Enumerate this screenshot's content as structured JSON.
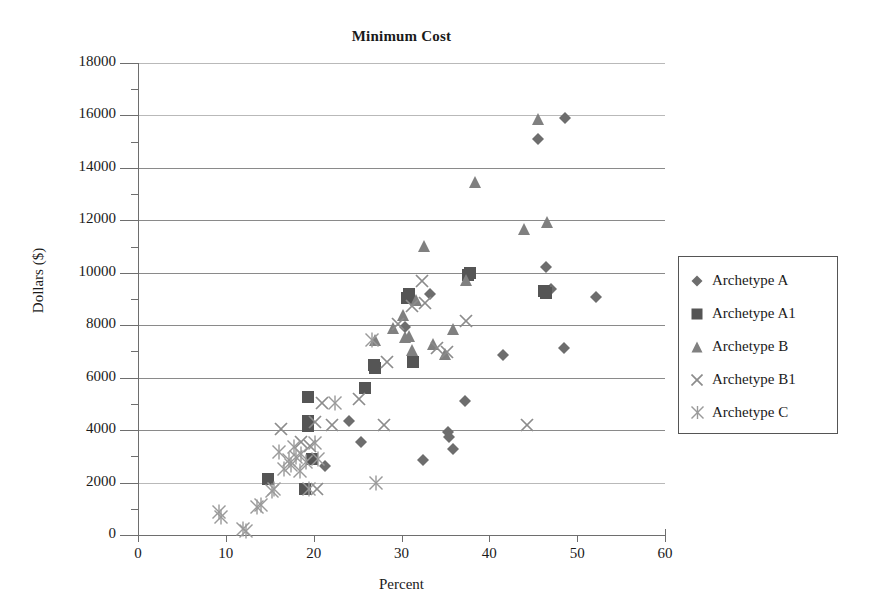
{
  "chart_data": {
    "type": "scatter",
    "title": "Minimum Cost",
    "xlabel": "Percent",
    "ylabel": "Dollars ($)",
    "xlim": [
      0,
      60
    ],
    "ylim": [
      0,
      18000
    ],
    "xticks": [
      "0",
      "10",
      "20",
      "30",
      "40",
      "50",
      "60"
    ],
    "yticks": [
      "0",
      "2000",
      "4000",
      "6000",
      "8000",
      "10000",
      "12000",
      "14000",
      "16000",
      "18000"
    ],
    "grid": "horizontal",
    "legend_position": "right",
    "series": [
      {
        "name": "Archetype A",
        "marker": "diamond",
        "color": "#6d6d6d",
        "points": [
          [
            21.3,
            2620
          ],
          [
            24.0,
            4350
          ],
          [
            25.4,
            3540
          ],
          [
            30.4,
            7930
          ],
          [
            32.4,
            2850
          ],
          [
            33.3,
            9180
          ],
          [
            35.3,
            3930
          ],
          [
            35.4,
            3750
          ],
          [
            35.9,
            3270
          ],
          [
            37.2,
            5120
          ],
          [
            41.5,
            6880
          ],
          [
            46.5,
            10220
          ],
          [
            47.0,
            9370
          ],
          [
            48.6,
            15900
          ],
          [
            45.5,
            15120
          ],
          [
            48.5,
            7130
          ],
          [
            52.2,
            9070
          ]
        ]
      },
      {
        "name": "Archetype A1",
        "marker": "square",
        "color": "#555555",
        "points": [
          [
            14.8,
            2150
          ],
          [
            19.0,
            1740
          ],
          [
            19.4,
            5280
          ],
          [
            19.3,
            4330
          ],
          [
            19.4,
            4140
          ],
          [
            19.8,
            2900
          ],
          [
            25.8,
            5600
          ],
          [
            26.9,
            6480
          ],
          [
            27.0,
            6350
          ],
          [
            30.8,
            9180
          ],
          [
            30.6,
            9030
          ],
          [
            31.3,
            6600
          ],
          [
            37.8,
            10010
          ],
          [
            37.6,
            9930
          ],
          [
            46.2,
            9300
          ],
          [
            46.4,
            9220
          ]
        ]
      },
      {
        "name": "Archetype B",
        "marker": "triangle",
        "color": "#808080",
        "points": [
          [
            27.0,
            7420
          ],
          [
            29.0,
            7900
          ],
          [
            30.2,
            8380
          ],
          [
            30.4,
            7560
          ],
          [
            30.9,
            7600
          ],
          [
            31.2,
            7070
          ],
          [
            31.7,
            8950
          ],
          [
            32.6,
            11020
          ],
          [
            33.6,
            7270
          ],
          [
            34.9,
            6900
          ],
          [
            35.9,
            7860
          ],
          [
            37.3,
            9730
          ],
          [
            38.4,
            13470
          ],
          [
            43.9,
            11670
          ],
          [
            45.5,
            15860
          ],
          [
            46.6,
            11940
          ]
        ]
      },
      {
        "name": "Archetype B1",
        "marker": "x",
        "color": "#8c8c8c",
        "points": [
          [
            16.3,
            4040
          ],
          [
            18.6,
            3560
          ],
          [
            19.6,
            3400
          ],
          [
            20.2,
            4300
          ],
          [
            20.4,
            1760
          ],
          [
            21.0,
            5030
          ],
          [
            22.1,
            4200
          ],
          [
            25.2,
            5200
          ],
          [
            28.0,
            4210
          ],
          [
            28.4,
            6610
          ],
          [
            29.6,
            8030
          ],
          [
            31.2,
            8740
          ],
          [
            32.3,
            9680
          ],
          [
            32.7,
            8830
          ],
          [
            34.0,
            7120
          ],
          [
            35.2,
            6990
          ],
          [
            37.3,
            8150
          ],
          [
            44.3,
            4190
          ]
        ]
      },
      {
        "name": "Archetype C",
        "marker": "asterisk",
        "color": "#9a9a9a",
        "points": [
          [
            9.2,
            890
          ],
          [
            9.5,
            680
          ],
          [
            11.9,
            230
          ],
          [
            12.3,
            160
          ],
          [
            13.6,
            1050
          ],
          [
            14.0,
            1130
          ],
          [
            15.2,
            1680
          ],
          [
            15.5,
            1760
          ],
          [
            16.0,
            3180
          ],
          [
            16.6,
            2530
          ],
          [
            17.2,
            2850
          ],
          [
            17.4,
            2660
          ],
          [
            17.8,
            3350
          ],
          [
            18.0,
            2970
          ],
          [
            18.4,
            2430
          ],
          [
            18.6,
            3080
          ],
          [
            19.1,
            2780
          ],
          [
            19.5,
            1750
          ],
          [
            20.1,
            3490
          ],
          [
            20.5,
            2900
          ],
          [
            22.4,
            5040
          ],
          [
            26.6,
            7420
          ],
          [
            27.1,
            2000
          ]
        ]
      }
    ]
  },
  "legend": {
    "entries": [
      {
        "label": "Archetype A"
      },
      {
        "label": "Archetype A1"
      },
      {
        "label": "Archetype B"
      },
      {
        "label": "Archetype B1"
      },
      {
        "label": "Archetype C"
      }
    ]
  }
}
